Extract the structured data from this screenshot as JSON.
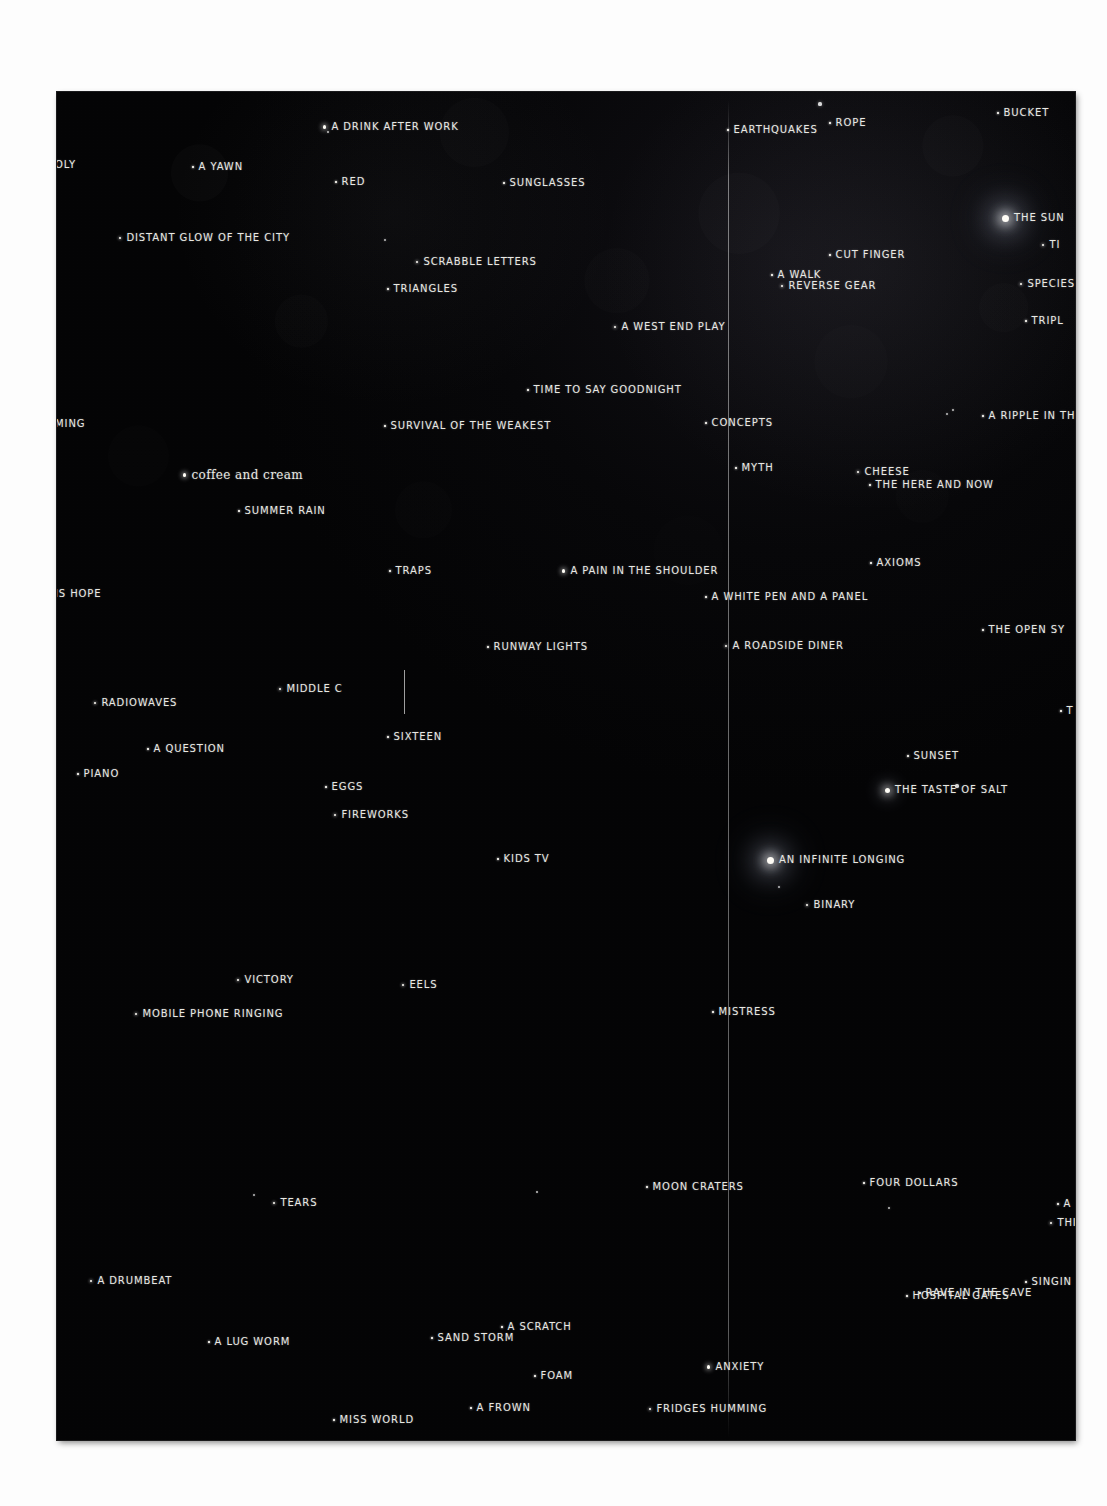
{
  "artwork": {
    "medium": "hand-lettered star chart on black ground",
    "plate_color": "#040405",
    "ink_color": "#e9e9e4",
    "plate": {
      "left": 57,
      "top": 92,
      "width": 1018,
      "height": 1348
    }
  },
  "guides": [
    {
      "name": "vertical-fold-line",
      "x": 671,
      "y": 8,
      "height": 1338
    },
    {
      "name": "short-tick-line",
      "x": 347,
      "y": 578,
      "height": 44
    }
  ],
  "entries": [
    {
      "label": "OLY",
      "x": -2,
      "y": 68,
      "mag": 0,
      "clipped": "left"
    },
    {
      "label": "A DRINK AFTER WORK",
      "x": 266,
      "y": 30,
      "mag": 3
    },
    {
      "label": "EARTHQUAKES",
      "x": 670,
      "y": 33,
      "mag": 1
    },
    {
      "label": "ROPE",
      "x": 772,
      "y": 26,
      "mag": 1
    },
    {
      "label": "BUCKET",
      "x": 940,
      "y": 16,
      "mag": 1
    },
    {
      "label": "A YAWN",
      "x": 135,
      "y": 70,
      "mag": 1
    },
    {
      "label": "RED",
      "x": 278,
      "y": 85,
      "mag": 1
    },
    {
      "label": "SUNGLASSES",
      "x": 446,
      "y": 86,
      "mag": 1
    },
    {
      "label": "THE SUN",
      "x": 945,
      "y": 121,
      "mag": 5
    },
    {
      "label": "DISTANT GLOW OF THE CITY",
      "x": 62,
      "y": 141,
      "mag": 2
    },
    {
      "label": "TI",
      "x": 985,
      "y": 148,
      "mag": 2,
      "clipped": "right"
    },
    {
      "label": "SCRABBLE LETTERS",
      "x": 359,
      "y": 165,
      "mag": 2
    },
    {
      "label": "CUT FINGER",
      "x": 772,
      "y": 158,
      "mag": 1
    },
    {
      "label": "A WALK",
      "x": 714,
      "y": 178,
      "mag": 1
    },
    {
      "label": "TRIANGLES",
      "x": 330,
      "y": 192,
      "mag": 1
    },
    {
      "label": "REVERSE GEAR",
      "x": 724,
      "y": 189,
      "mag": 2
    },
    {
      "label": "SPECIES",
      "x": 963,
      "y": 187,
      "mag": 2,
      "clipped": "right"
    },
    {
      "label": "A WEST END PLAY",
      "x": 557,
      "y": 230,
      "mag": 2
    },
    {
      "label": "TRIPL",
      "x": 968,
      "y": 224,
      "mag": 1,
      "clipped": "right"
    },
    {
      "label": "TIME TO SAY GOODNIGHT",
      "x": 470,
      "y": 293,
      "mag": 1
    },
    {
      "label": "MING",
      "x": -2,
      "y": 327,
      "mag": 0,
      "clipped": "left"
    },
    {
      "label": "SURVIVAL OF THE WEAKEST",
      "x": 327,
      "y": 329,
      "mag": 1
    },
    {
      "label": "CONCEPTS",
      "x": 648,
      "y": 326,
      "mag": 1
    },
    {
      "label": "A RIPPLE IN TH",
      "x": 925,
      "y": 319,
      "mag": 1,
      "clipped": "right"
    },
    {
      "label": "MYTH",
      "x": 678,
      "y": 371,
      "mag": 1
    },
    {
      "label": "coffee and cream",
      "x": 126,
      "y": 377,
      "mag": 3,
      "style": "script"
    },
    {
      "label": "CHEESE",
      "x": 800,
      "y": 375,
      "mag": 2
    },
    {
      "label": "THE HERE AND NOW",
      "x": 812,
      "y": 388,
      "mag": 1
    },
    {
      "label": "SUMMER RAIN",
      "x": 181,
      "y": 414,
      "mag": 1
    },
    {
      "label": "AXIOMS",
      "x": 813,
      "y": 466,
      "mag": 1
    },
    {
      "label": "TRAPS",
      "x": 332,
      "y": 474,
      "mag": 1
    },
    {
      "label": "A PAIN IN THE SHOULDER",
      "x": 505,
      "y": 474,
      "mag": 3
    },
    {
      "label": "IS HOPE",
      "x": -2,
      "y": 497,
      "mag": 0,
      "clipped": "left"
    },
    {
      "label": "A WHITE PEN AND A PANEL",
      "x": 648,
      "y": 500,
      "mag": 1
    },
    {
      "label": "THE OPEN SY",
      "x": 925,
      "y": 533,
      "mag": 1,
      "clipped": "right"
    },
    {
      "label": "RUNWAY LIGHTS",
      "x": 430,
      "y": 550,
      "mag": 1
    },
    {
      "label": "A ROADSIDE DINER",
      "x": 668,
      "y": 549,
      "mag": 2
    },
    {
      "label": "MIDDLE C",
      "x": 222,
      "y": 592,
      "mag": 2
    },
    {
      "label": "RADIOWAVES",
      "x": 37,
      "y": 606,
      "mag": 2
    },
    {
      "label": "T",
      "x": 1003,
      "y": 614,
      "mag": 1,
      "clipped": "right"
    },
    {
      "label": "SIXTEEN",
      "x": 330,
      "y": 640,
      "mag": 1
    },
    {
      "label": "A QUESTION",
      "x": 90,
      "y": 652,
      "mag": 1
    },
    {
      "label": "SUNSET",
      "x": 850,
      "y": 659,
      "mag": 1
    },
    {
      "label": "PIANO",
      "x": 20,
      "y": 677,
      "mag": 1
    },
    {
      "label": "EGGS",
      "x": 268,
      "y": 690,
      "mag": 1
    },
    {
      "label": "THE TASTE OF SALT",
      "x": 828,
      "y": 693,
      "mag": 4
    },
    {
      "label": "FIREWORKS",
      "x": 277,
      "y": 718,
      "mag": 2
    },
    {
      "label": "KIDS TV",
      "x": 440,
      "y": 762,
      "mag": 1
    },
    {
      "label": "AN INFINITE LONGING",
      "x": 710,
      "y": 763,
      "mag": 5
    },
    {
      "label": "BINARY",
      "x": 749,
      "y": 808,
      "mag": 2
    },
    {
      "label": "VICTORY",
      "x": 180,
      "y": 883,
      "mag": 2
    },
    {
      "label": "EELS",
      "x": 345,
      "y": 888,
      "mag": 2
    },
    {
      "label": "MISTRESS",
      "x": 655,
      "y": 915,
      "mag": 1
    },
    {
      "label": "MOBILE PHONE RINGING",
      "x": 78,
      "y": 917,
      "mag": 2
    },
    {
      "label": "MOON CRATERS",
      "x": 589,
      "y": 1090,
      "mag": 1
    },
    {
      "label": "FOUR DOLLARS",
      "x": 806,
      "y": 1086,
      "mag": 1
    },
    {
      "label": "TEARS",
      "x": 216,
      "y": 1106,
      "mag": 2
    },
    {
      "label": "A",
      "x": 1000,
      "y": 1107,
      "mag": 1,
      "clipped": "right"
    },
    {
      "label": "THI",
      "x": 993,
      "y": 1126,
      "mag": 2,
      "clipped": "right"
    },
    {
      "label": "A DRUMBEAT",
      "x": 33,
      "y": 1184,
      "mag": 2
    },
    {
      "label": "SINGIN",
      "x": 968,
      "y": 1185,
      "mag": 1,
      "clipped": "right"
    },
    {
      "label": "HOSPITAL GATES",
      "x": 849,
      "y": 1199,
      "mag": 1
    },
    {
      "label": "A SCRATCH",
      "x": 444,
      "y": 1230,
      "mag": 1
    },
    {
      "label": "FOAM",
      "x": 477,
      "y": 1279,
      "mag": 1
    },
    {
      "label": "RAVE IN THE CAVE",
      "x": 862,
      "y": 1196,
      "mag": 1
    },
    {
      "label": "A FROWN",
      "x": 413,
      "y": 1311,
      "mag": 1
    },
    {
      "label": "FRIDGES HUMMING",
      "x": 592,
      "y": 1312,
      "mag": 2
    },
    {
      "label": "A LUG WORM",
      "x": 151,
      "y": 1245,
      "mag": 1
    },
    {
      "label": "SAND STORM",
      "x": 374,
      "y": 1241,
      "mag": 1
    },
    {
      "label": "ANXIETY",
      "x": 650,
      "y": 1270,
      "mag": 3
    },
    {
      "label": "MISS WORLD",
      "x": 276,
      "y": 1323,
      "mag": 1
    }
  ],
  "field_stars": [
    {
      "x": 271,
      "y": 40,
      "r": 1.2
    },
    {
      "x": 763,
      "y": 12,
      "r": 1.6
    },
    {
      "x": 328,
      "y": 148,
      "r": 1.0
    },
    {
      "x": 890,
      "y": 322,
      "r": 1.0
    },
    {
      "x": 896,
      "y": 318,
      "r": 0.9
    },
    {
      "x": 900,
      "y": 694,
      "r": 1.6
    },
    {
      "x": 722,
      "y": 795,
      "r": 1.0
    },
    {
      "x": 197,
      "y": 1103,
      "r": 1.0
    },
    {
      "x": 832,
      "y": 1116,
      "r": 1.1
    },
    {
      "x": 480,
      "y": 1100,
      "r": 0.8
    },
    {
      "x": 160,
      "y": 920,
      "r": 1.2
    }
  ]
}
